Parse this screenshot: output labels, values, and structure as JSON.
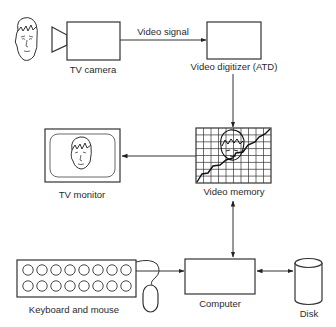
{
  "diagram": {
    "nodes": [
      {
        "id": "subject",
        "label": "",
        "icon": "face-icon"
      },
      {
        "id": "tv_camera",
        "label": "TV camera",
        "icon": "camera-icon"
      },
      {
        "id": "video_digitizer",
        "label": "Video digitizer (ATD)"
      },
      {
        "id": "video_memory",
        "label": "Video memory",
        "icon": "grid-image-icon"
      },
      {
        "id": "tv_monitor",
        "label": "TV monitor",
        "icon": "monitor-icon"
      },
      {
        "id": "computer",
        "label": "Computer"
      },
      {
        "id": "disk",
        "label": "Disk",
        "icon": "cylinder-icon"
      },
      {
        "id": "keyboard_mouse",
        "label": "Keyboard and mouse",
        "icon": "keyboard-icon"
      }
    ],
    "edges": [
      {
        "from": "tv_camera",
        "to": "video_digitizer",
        "label": "Video signal",
        "direction": "forward"
      },
      {
        "from": "video_digitizer",
        "to": "video_memory",
        "label": "",
        "direction": "forward"
      },
      {
        "from": "video_memory",
        "to": "tv_monitor",
        "label": "",
        "direction": "forward"
      },
      {
        "from": "video_memory",
        "to": "computer",
        "label": "",
        "direction": "both"
      },
      {
        "from": "keyboard_mouse",
        "to": "computer",
        "label": "",
        "direction": "forward"
      },
      {
        "from": "computer",
        "to": "disk",
        "label": "",
        "direction": "both"
      }
    ]
  },
  "labels": {
    "tv_camera": "TV camera",
    "video_signal": "Video signal",
    "video_digitizer": "Video digitizer (ATD)",
    "video_memory": "Video memory",
    "tv_monitor": "TV monitor",
    "computer": "Computer",
    "disk": "Disk",
    "keyboard_mouse": "Keyboard and mouse"
  }
}
